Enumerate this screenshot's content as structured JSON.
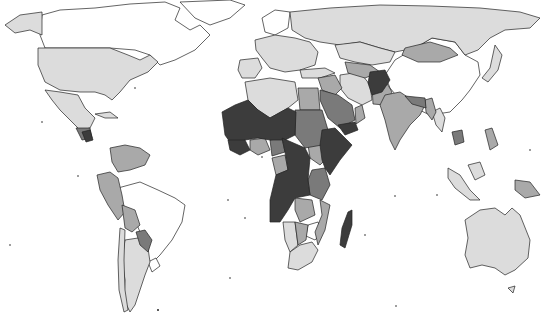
{
  "map": {
    "type": "choropleth",
    "projection": "world (Robinson-like)",
    "width": 549,
    "height": 331,
    "background": "#ffffff",
    "border_color": "#222222",
    "classes": [
      {
        "level": 0,
        "fill": "#ffffff",
        "description": "no data"
      },
      {
        "level": 1,
        "fill": "#dcdcdc",
        "description": "lowest"
      },
      {
        "level": 2,
        "fill": "#a9a9a9",
        "description": "low-medium"
      },
      {
        "level": 3,
        "fill": "#7a7a7a",
        "description": "medium-high"
      },
      {
        "level": 4,
        "fill": "#3c3c3c",
        "description": "highest"
      }
    ],
    "regions": {
      "level0": [
        "Canada",
        "Greenland",
        "Brazil",
        "China",
        "Uruguay",
        "Zimbabwe",
        "Nordic Europe (parts)",
        "Western Sahara"
      ],
      "level1": [
        "USA",
        "Mexico",
        "Argentina",
        "Chile",
        "Russia",
        "Kazakhstan",
        "Europe",
        "Iran",
        "Australia",
        "Japan",
        "Algeria",
        "Libya",
        "South Africa",
        "Namibia",
        "Thailand",
        "Malaysia",
        "Indonesia (parts)",
        "Turkey",
        "Cuba"
      ],
      "level2": [
        "Colombia",
        "Venezuela",
        "Peru",
        "Bolivia",
        "Ecuador",
        "Mongolia",
        "India",
        "Egypt",
        "Saudi Arabia",
        "Oman",
        "Pakistan",
        "Angola (parts)",
        "Botswana",
        "Mozambique",
        "Zambia",
        "Central Asia",
        "Myanmar",
        "Papua New Guinea",
        "Philippines",
        "Ghana",
        "Côte d'Ivoire",
        "Iraq",
        "Syria"
      ],
      "level3": [
        "Paraguay",
        "Guatemala",
        "Honduras",
        "Sudan",
        "Yemen (parts)",
        "Kenya",
        "Tanzania",
        "Cambodia",
        "Bangladesh",
        "Nepal",
        "Gabon",
        "Cameroon",
        "Malawi"
      ],
      "level4": [
        "Afghanistan",
        "Mauritania",
        "Mali",
        "Niger",
        "Chad",
        "Nigeria",
        "Burkina Faso",
        "Guinea",
        "Sierra Leone",
        "Liberia",
        "DR Congo",
        "Central African Republic",
        "South Sudan",
        "Ethiopia",
        "Somalia",
        "Eritrea",
        "Yemen",
        "Madagascar",
        "Nicaragua"
      ]
    }
  }
}
